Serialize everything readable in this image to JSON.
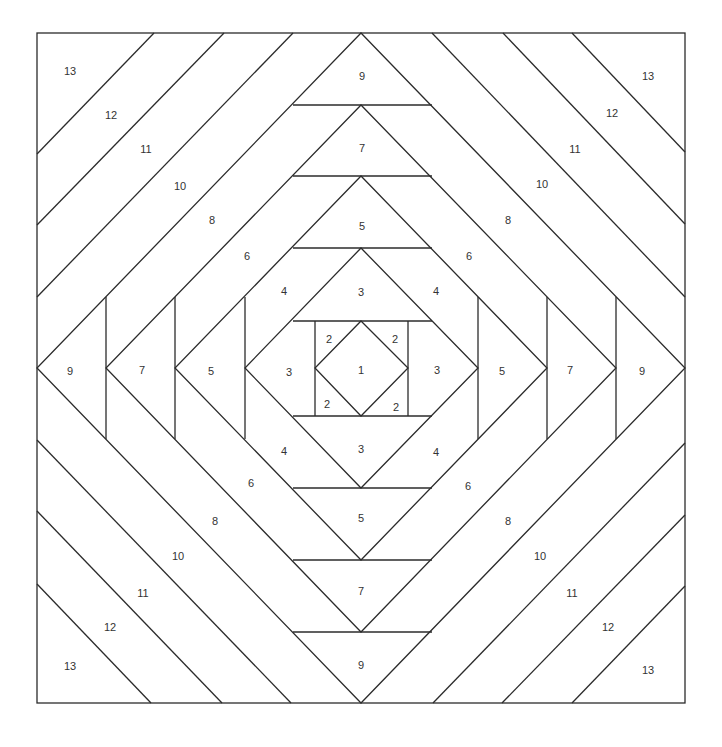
{
  "diagram": {
    "colors": {
      "stroke": "#2b2b2b",
      "label": "#333333",
      "background": "#ffffff"
    },
    "border": {
      "x1": 37,
      "y1": 33,
      "x2": 685,
      "y2": 703
    },
    "center": {
      "x": 361,
      "y": 368
    },
    "diamonds": [
      {
        "name": "diamond-9",
        "points": [
          [
            361,
            33
          ],
          [
            685,
            368
          ],
          [
            361,
            703
          ],
          [
            37,
            368
          ]
        ]
      },
      {
        "name": "diamond-7",
        "points": [
          [
            361,
            105
          ],
          [
            616,
            368
          ],
          [
            361,
            632
          ],
          [
            106,
            368
          ]
        ]
      },
      {
        "name": "diamond-5",
        "points": [
          [
            361,
            176
          ],
          [
            547,
            368
          ],
          [
            361,
            560
          ],
          [
            175,
            368
          ]
        ]
      },
      {
        "name": "diamond-3",
        "points": [
          [
            361,
            248
          ],
          [
            478,
            368
          ],
          [
            361,
            488
          ],
          [
            245,
            368
          ]
        ]
      },
      {
        "name": "diamond-1",
        "points": [
          [
            361,
            321
          ],
          [
            408,
            368
          ],
          [
            361,
            416
          ],
          [
            315,
            368
          ]
        ]
      }
    ],
    "horizontal_chords": [
      {
        "y": 105,
        "x1": 293,
        "x2": 432
      },
      {
        "y": 176,
        "x1": 293,
        "x2": 432
      },
      {
        "y": 248,
        "x1": 293,
        "x2": 432
      },
      {
        "y": 321,
        "x1": 293,
        "x2": 432
      },
      {
        "y": 416,
        "x1": 293,
        "x2": 432
      },
      {
        "y": 488,
        "x1": 293,
        "x2": 432
      },
      {
        "y": 560,
        "x1": 293,
        "x2": 432
      },
      {
        "y": 632,
        "x1": 293,
        "x2": 432
      }
    ],
    "vertical_chords": [
      {
        "x": 106,
        "y1": 297,
        "y2": 439
      },
      {
        "x": 175,
        "y1": 297,
        "y2": 439
      },
      {
        "x": 245,
        "y1": 297,
        "y2": 439
      },
      {
        "x": 315,
        "y1": 321,
        "y2": 416
      },
      {
        "x": 408,
        "y1": 321,
        "y2": 416
      },
      {
        "x": 478,
        "y1": 297,
        "y2": 439
      },
      {
        "x": 547,
        "y1": 297,
        "y2": 439
      },
      {
        "x": 616,
        "y1": 297,
        "y2": 439
      }
    ],
    "corner_stripes": [
      {
        "x1": 154,
        "y1": 33,
        "x2": 37,
        "y2": 154
      },
      {
        "x1": 224,
        "y1": 33,
        "x2": 37,
        "y2": 225
      },
      {
        "x1": 293,
        "y1": 33,
        "x2": 37,
        "y2": 297
      },
      {
        "x1": 432,
        "y1": 33,
        "x2": 685,
        "y2": 297
      },
      {
        "x1": 503,
        "y1": 33,
        "x2": 685,
        "y2": 224
      },
      {
        "x1": 572,
        "y1": 33,
        "x2": 685,
        "y2": 152
      },
      {
        "x1": 37,
        "y1": 440,
        "x2": 291,
        "y2": 703
      },
      {
        "x1": 37,
        "y1": 511,
        "x2": 222,
        "y2": 703
      },
      {
        "x1": 37,
        "y1": 584,
        "x2": 151,
        "y2": 703
      },
      {
        "x1": 685,
        "y1": 443,
        "x2": 433,
        "y2": 703
      },
      {
        "x1": 685,
        "y1": 515,
        "x2": 502,
        "y2": 703
      },
      {
        "x1": 685,
        "y1": 586,
        "x2": 572,
        "y2": 703
      }
    ],
    "labels": [
      {
        "text": "13",
        "x": 70,
        "y": 71
      },
      {
        "text": "13",
        "x": 648,
        "y": 76
      },
      {
        "text": "13",
        "x": 70,
        "y": 666
      },
      {
        "text": "13",
        "x": 648,
        "y": 670
      },
      {
        "text": "12",
        "x": 111,
        "y": 115
      },
      {
        "text": "12",
        "x": 612,
        "y": 113
      },
      {
        "text": "12",
        "x": 110,
        "y": 627
      },
      {
        "text": "12",
        "x": 608,
        "y": 627
      },
      {
        "text": "11",
        "x": 146,
        "y": 149
      },
      {
        "text": "11",
        "x": 575,
        "y": 149
      },
      {
        "text": "11",
        "x": 143,
        "y": 593
      },
      {
        "text": "11",
        "x": 572,
        "y": 593
      },
      {
        "text": "10",
        "x": 180,
        "y": 186
      },
      {
        "text": "10",
        "x": 542,
        "y": 184
      },
      {
        "text": "10",
        "x": 178,
        "y": 556
      },
      {
        "text": "10",
        "x": 540,
        "y": 556
      },
      {
        "text": "9",
        "x": 362,
        "y": 76
      },
      {
        "text": "9",
        "x": 70,
        "y": 371
      },
      {
        "text": "9",
        "x": 642,
        "y": 371
      },
      {
        "text": "9",
        "x": 361,
        "y": 665
      },
      {
        "text": "8",
        "x": 212,
        "y": 220
      },
      {
        "text": "8",
        "x": 508,
        "y": 220
      },
      {
        "text": "8",
        "x": 215,
        "y": 521
      },
      {
        "text": "8",
        "x": 508,
        "y": 521
      },
      {
        "text": "7",
        "x": 362,
        "y": 148
      },
      {
        "text": "7",
        "x": 142,
        "y": 370
      },
      {
        "text": "7",
        "x": 570,
        "y": 370
      },
      {
        "text": "7",
        "x": 361,
        "y": 591
      },
      {
        "text": "6",
        "x": 247,
        "y": 256
      },
      {
        "text": "6",
        "x": 469,
        "y": 256
      },
      {
        "text": "6",
        "x": 251,
        "y": 483
      },
      {
        "text": "6",
        "x": 468,
        "y": 486
      },
      {
        "text": "5",
        "x": 362,
        "y": 226
      },
      {
        "text": "5",
        "x": 211,
        "y": 371
      },
      {
        "text": "5",
        "x": 502,
        "y": 371
      },
      {
        "text": "5",
        "x": 361,
        "y": 518
      },
      {
        "text": "4",
        "x": 284,
        "y": 291
      },
      {
        "text": "4",
        "x": 436,
        "y": 291
      },
      {
        "text": "4",
        "x": 284,
        "y": 451
      },
      {
        "text": "4",
        "x": 436,
        "y": 452
      },
      {
        "text": "3",
        "x": 361,
        "y": 292
      },
      {
        "text": "3",
        "x": 289,
        "y": 372
      },
      {
        "text": "3",
        "x": 437,
        "y": 370
      },
      {
        "text": "3",
        "x": 361,
        "y": 449
      },
      {
        "text": "2",
        "x": 329,
        "y": 339
      },
      {
        "text": "2",
        "x": 395,
        "y": 339
      },
      {
        "text": "2",
        "x": 327,
        "y": 404
      },
      {
        "text": "2",
        "x": 396,
        "y": 407
      },
      {
        "text": "1",
        "x": 361,
        "y": 370
      }
    ]
  }
}
